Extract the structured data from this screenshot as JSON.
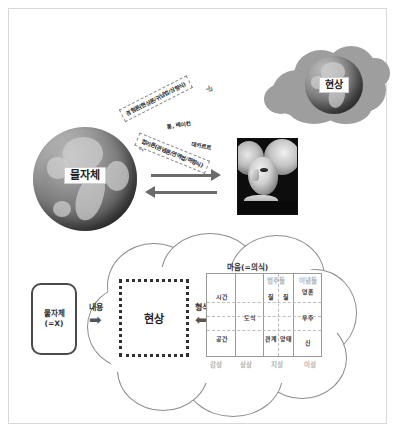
{
  "diagram": {
    "title_top": "칸트 인식론 — 물자체와 현상",
    "top_panel": {
      "thing_in_itself_label": "물자체",
      "phenomenon_label": "현상",
      "empiricism_callout": "경험론(현상론/귀납법/상향식)",
      "empiricism_thinkers": "통, 베이컨",
      "rationalism_callout": "합리론(관념론/연역법/하향식)",
      "rationalism_thinkers": "데카르트",
      "portrait_name": "칸트",
      "chevron_up": "»",
      "chevron_down": "»"
    },
    "bottom_panel": {
      "source_box_line1": "물자체",
      "source_box_line2": "(=X)",
      "content_label": "내용",
      "content_arrow": "➡",
      "phenomenon_box": "현상",
      "form_label": "형식",
      "form_arrow": "⬅",
      "mind_title": "마음(=의식)",
      "col_header_categories": "범주들",
      "col_header_ideas": "이념들",
      "cells": {
        "time": "시간",
        "space": "공간",
        "schema": "도식",
        "quality": "질",
        "relation": "관계",
        "quantity": "질",
        "modality": "양태",
        "soul": "영혼",
        "cosmos": "우주",
        "god": "신"
      },
      "faculties": [
        "감성",
        "상상",
        "지성",
        "이성"
      ]
    }
  },
  "colors": {
    "frame_border": "#d8d8d8",
    "cloud_gray": "#9e9e9e",
    "arrow_gray": "#6b6b6b",
    "outline": "#8d8d8d",
    "text": "#222222"
  }
}
